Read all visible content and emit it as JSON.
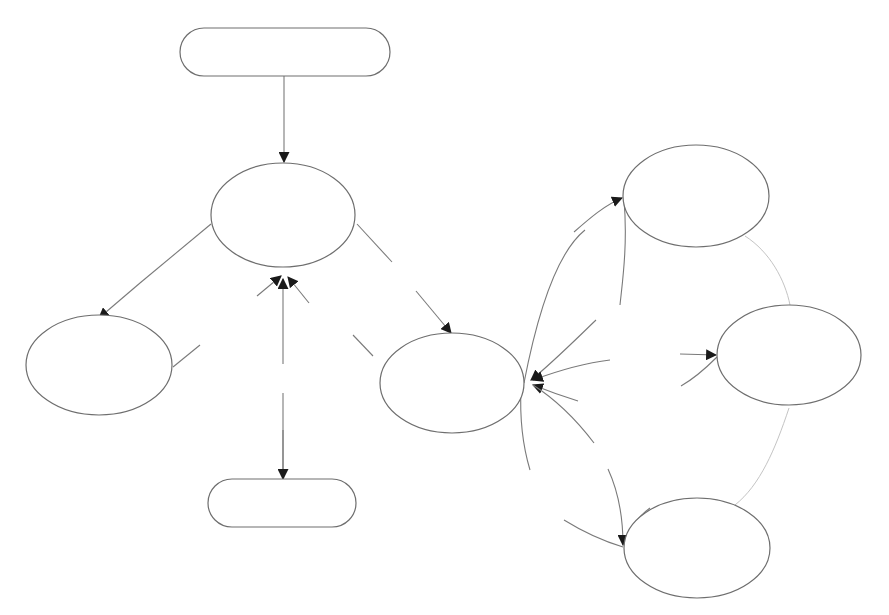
{
  "diagram": {
    "type": "flow-graph",
    "background": "#ffffff",
    "colors": {
      "stroke": "#6e6e6e",
      "edge": "#7a7a7a",
      "faint_edge": "#c4c4c4",
      "arrowhead": "#1a1a1a"
    },
    "nodes": [
      {
        "id": "start",
        "shape": "rounded-rectangle",
        "label": "",
        "cx": 285,
        "cy": 40,
        "w": 210,
        "h": 48
      },
      {
        "id": "central",
        "shape": "ellipse",
        "label": "",
        "cx": 283,
        "cy": 215,
        "rx": 72,
        "ry": 52
      },
      {
        "id": "left",
        "shape": "ellipse",
        "label": "",
        "cx": 99,
        "cy": 365,
        "rx": 73,
        "ry": 50
      },
      {
        "id": "hub",
        "shape": "ellipse",
        "label": "",
        "cx": 452,
        "cy": 383,
        "rx": 72,
        "ry": 50
      },
      {
        "id": "end",
        "shape": "rounded-rectangle",
        "label": "",
        "cx": 282,
        "cy": 503,
        "w": 148,
        "h": 48
      },
      {
        "id": "right-top",
        "shape": "ellipse",
        "label": "",
        "cx": 696,
        "cy": 196,
        "rx": 73,
        "ry": 51
      },
      {
        "id": "right-mid",
        "shape": "ellipse",
        "label": "",
        "cx": 789,
        "cy": 355,
        "rx": 72,
        "ry": 50
      },
      {
        "id": "right-bottom",
        "shape": "ellipse",
        "label": "",
        "cx": 697,
        "cy": 548,
        "rx": 73,
        "ry": 50
      }
    ],
    "edges": [
      {
        "from": "start",
        "to": "central",
        "arrow": true
      },
      {
        "from": "central",
        "to": "left",
        "arrow": true
      },
      {
        "from": "central",
        "to": "hub",
        "arrow": true
      },
      {
        "from": "left",
        "to": "central",
        "arrow": true
      },
      {
        "from": "end",
        "to": "central",
        "arrow": true
      },
      {
        "from": "hub",
        "to": "central",
        "arrow": true
      },
      {
        "from": "central",
        "to": "end",
        "arrow": true
      },
      {
        "from": "hub",
        "to": "right-top",
        "arrow": true
      },
      {
        "from": "hub",
        "to": "right-mid",
        "arrow": true
      },
      {
        "from": "hub",
        "to": "right-bottom",
        "arrow": true
      },
      {
        "from": "right-top",
        "to": "hub",
        "arrow": true
      },
      {
        "from": "right-mid",
        "to": "hub",
        "arrow": true
      },
      {
        "from": "right-bottom",
        "to": "hub",
        "arrow": true
      },
      {
        "from": "right-top",
        "to": "right-mid",
        "arrow": false,
        "faint": true
      },
      {
        "from": "right-mid",
        "to": "right-bottom",
        "arrow": false,
        "faint": true
      }
    ]
  }
}
